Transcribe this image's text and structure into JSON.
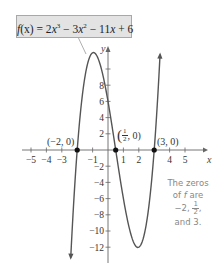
{
  "chart_data": {
    "type": "line",
    "function": {
      "name": "f",
      "expression": "2x^3 - 3x^2 - 11x + 6",
      "coefficients": [
        2,
        -3,
        -11,
        6
      ]
    },
    "xlabel": "x",
    "ylabel": "y",
    "xlim": [
      -5.5,
      6.2
    ],
    "ylim": [
      -13.5,
      12.5
    ],
    "x_ticks": [
      -5,
      -4,
      -3,
      -1,
      1,
      2,
      4,
      5
    ],
    "x_tick_labels": [
      "−5",
      "−4",
      "−3",
      "−1",
      "1",
      "2",
      "4",
      "5"
    ],
    "y_ticks": [
      -12,
      -10,
      -8,
      -6,
      -4,
      -2,
      2,
      4,
      6,
      8,
      10
    ],
    "y_tick_labels": [
      "−12",
      "−10",
      "−8",
      "−6",
      "−4",
      "−2",
      "2",
      "4",
      "6",
      "8",
      ""
    ],
    "grid": false,
    "curve_domain": [
      -2.42,
      3.38
    ],
    "local_max": {
      "x": -0.76,
      "y": 11.75
    },
    "local_min": {
      "x": 2,
      "y": -12
    },
    "zeros": [
      {
        "x": -2,
        "y": 0,
        "label": "(−2, 0)"
      },
      {
        "x": 0.5,
        "y": 0,
        "label": "(1/2, 0)"
      },
      {
        "x": 3,
        "y": 0,
        "label": "(3, 0)"
      }
    ],
    "annotations": [
      "f(x) = 2x³ − 3x² − 11x + 6",
      "The zeros of f are −2, 1/2, and 3."
    ]
  },
  "callout": {
    "fx": "f",
    "paren_x": "(x)",
    "eq": " = 2",
    "x1": "x",
    "sup3": "3",
    "minus3": " − 3",
    "x2": "x",
    "sup2": "2",
    "rest": " − 11",
    "x3": "x",
    "plus6": " + 6"
  },
  "labels": {
    "zero1": "(−2, 0)",
    "zero2_open": "(",
    "zero2_num": "1",
    "zero2_den": "2",
    "zero2_close": ", 0)",
    "zero3": "(3, 0)"
  },
  "note": {
    "line1": "The zeros",
    "line2a": "of ",
    "line2f": "f",
    "line2b": " are",
    "line3a": "−2, ",
    "line3num": "1",
    "line3den": "2",
    "line3b": ",",
    "line4": "and 3."
  },
  "colors": {
    "curve": "#555555",
    "axis": "#666666",
    "callout_bg": "#e3e3e3",
    "note": "#888888",
    "dot": "#111111"
  }
}
